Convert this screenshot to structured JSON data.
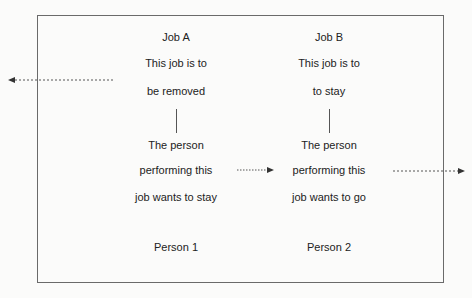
{
  "diagram": {
    "columns": [
      {
        "job_title": "Job A",
        "job_line1": "This job is to",
        "job_line2": "be removed",
        "person_line1": "The person",
        "person_line2": "performing this",
        "person_line3": "job wants to stay",
        "person_label": "Person 1"
      },
      {
        "job_title": "Job B",
        "job_line1": "This job is to",
        "job_line2": "to stay",
        "person_line1": "The person",
        "person_line2": "performing this",
        "person_line3": "job wants to go",
        "person_label": "Person 2"
      }
    ],
    "arrows": [
      {
        "name": "job-a-out-arrow",
        "direction": "left",
        "style": "dashed"
      },
      {
        "name": "person-1-to-job-b-arrow",
        "direction": "right",
        "style": "dashed"
      },
      {
        "name": "person-2-out-arrow",
        "direction": "right",
        "style": "dashed"
      }
    ],
    "colors": {
      "line": "#555555",
      "frame": "#6a6a6a",
      "text": "#222222",
      "background": "#fbfbfa"
    }
  }
}
